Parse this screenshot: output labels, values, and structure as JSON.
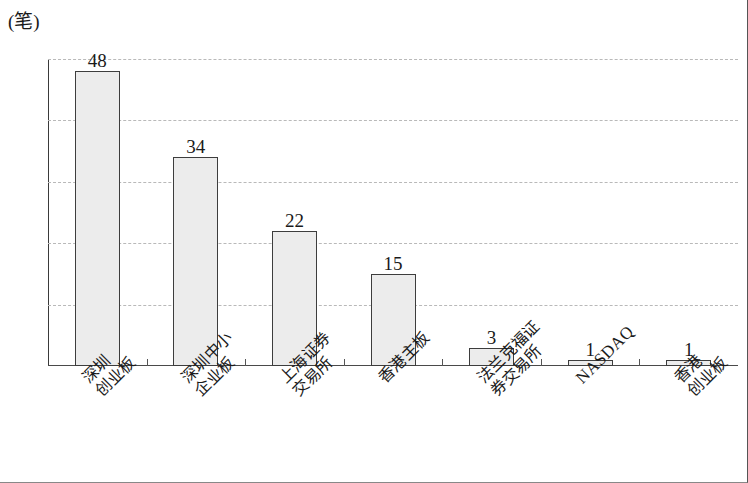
{
  "chart_data": {
    "type": "bar",
    "title": "",
    "unit_label": "(笔)",
    "xlabel": "",
    "ylabel": "",
    "ylim": [
      0,
      50
    ],
    "yticks": [
      0,
      10,
      20,
      30,
      40,
      50
    ],
    "ytick_labels": [
      "0",
      "10",
      "20",
      "30",
      "40",
      "50"
    ],
    "grid": true,
    "grid_style": "dotted-horizontal",
    "legend": "none",
    "categories": [
      "深圳创业板",
      "深圳中小企业板",
      "上海证券交易所",
      "香港主板",
      "法兰克福证券交易所",
      "NASDAQ",
      "香港创业板"
    ],
    "category_lines": [
      [
        "深圳",
        "创业板"
      ],
      [
        "深圳中小",
        "企业板"
      ],
      [
        "上海证券",
        "交易所"
      ],
      [
        "香港主板"
      ],
      [
        "法兰克福证",
        "券交易所"
      ],
      [
        "NASDAQ"
      ],
      [
        "香港",
        "创业板"
      ]
    ],
    "values": [
      48,
      34,
      22,
      15,
      3,
      1,
      1
    ],
    "value_labels": [
      "48",
      "34",
      "22",
      "15",
      "3",
      "1",
      "1"
    ],
    "colors": {
      "bar_fill": "#ececec",
      "bar_border": "#3d3d3d",
      "axis": "#3a3a3a",
      "gridline": "#b9b9b9",
      "text": "#1a1a1a",
      "background": "#ffffff"
    }
  }
}
